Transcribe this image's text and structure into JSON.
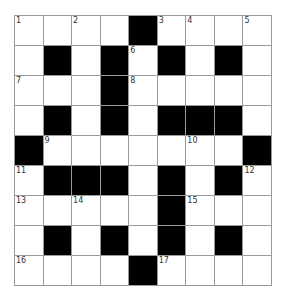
{
  "puzzle": {
    "rows": 9,
    "cols": 9,
    "colors": {
      "black": "#000000",
      "white": "#ffffff",
      "line": "#9a9a9a"
    },
    "grid": [
      [
        "1",
        "",
        "2",
        "",
        "#",
        "3",
        "4",
        "",
        "5"
      ],
      [
        "",
        "#",
        "",
        "#",
        "6",
        "#",
        "",
        "#",
        ""
      ],
      [
        "7",
        "",
        "",
        "#",
        "8",
        "",
        "",
        "",
        ""
      ],
      [
        "",
        "#",
        "",
        "#",
        "",
        "#",
        "#",
        "#",
        ""
      ],
      [
        "#",
        "9",
        "",
        "",
        "",
        "",
        "10",
        "",
        "#"
      ],
      [
        "11",
        "#",
        "#",
        "#",
        "",
        "#",
        "",
        "#",
        "12"
      ],
      [
        "13",
        "",
        "14",
        "",
        "",
        "#",
        "15",
        "",
        ""
      ],
      [
        "",
        "#",
        "",
        "#",
        "",
        "#",
        "",
        "#",
        ""
      ],
      [
        "16",
        "",
        "",
        "",
        "#",
        "17",
        "",
        "",
        ""
      ]
    ]
  }
}
